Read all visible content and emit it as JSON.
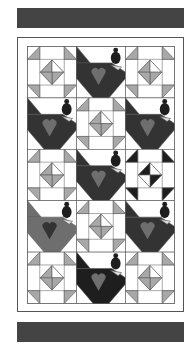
{
  "quilt": {
    "colors": {
      "bar": "#444444",
      "border_line": "#555555",
      "background": "#ffffff",
      "light_grey": "#a8a8a8",
      "medium_grey": "#6e6e6e",
      "dark": "#333333",
      "darkest": "#1e1e1e"
    },
    "layout": {
      "rows": 5,
      "cols": 3,
      "blocks": [
        [
          "star-grey",
          "chicken-dark",
          "star-grey"
        ],
        [
          "chicken-dark",
          "star-grey",
          "chicken-dark"
        ],
        [
          "star-grey",
          "chicken-dark",
          "star-dark"
        ],
        [
          "chicken-medium",
          "star-grey",
          "chicken-dark"
        ],
        [
          "star-grey",
          "chicken-darkest",
          "star-grey"
        ]
      ]
    }
  }
}
